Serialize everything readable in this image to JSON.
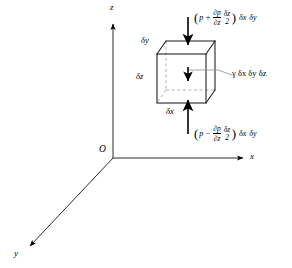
{
  "figure": {
    "background_color": "#ffffff",
    "line_color": "#000000",
    "dashed_color": "#9a9a9a"
  },
  "axes": {
    "origin_label": "O",
    "x_label": "x",
    "y_label": "y",
    "z_label": "z"
  },
  "element": {
    "dim_x_label": "δx",
    "dim_y_label": "δy",
    "dim_z_label": "δz"
  },
  "forces": {
    "top": {
      "open_paren": "(",
      "pressure_symbol": "p",
      "operator": "+",
      "frac1_num": "∂p",
      "frac1_den": "∂z",
      "frac2_num": "δz",
      "frac2_den": "2",
      "close_paren": ")",
      "area_term_1": "δx",
      "area_term_2": "δy",
      "plain_text": "(p + ∂p/∂z · δz/2) δx δy"
    },
    "bottom": {
      "open_paren": "(",
      "pressure_symbol": "p",
      "operator": "−",
      "frac1_num": "∂p",
      "frac1_den": "∂z",
      "frac2_num": "δz",
      "frac2_den": "2",
      "close_paren": ")",
      "area_term_1": "δx",
      "area_term_2": "δy",
      "plain_text": "(p − ∂p/∂z · δz/2) δx δy"
    },
    "weight": {
      "label": "γ δx δy δz",
      "symbol": "γ"
    }
  },
  "icons": {
    "arrow_down_top": "arrow-down-icon",
    "arrow_up_bottom": "arrow-up-icon",
    "arrow_down_weight": "arrow-down-small-icon",
    "axis_arrow": "axis-arrowhead-icon"
  }
}
